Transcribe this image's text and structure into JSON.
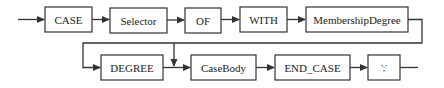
{
  "diagram": {
    "type": "syntax-diagram",
    "nodes": [
      {
        "id": "case",
        "label": "CASE",
        "x": 45,
        "y": 7,
        "w": 47,
        "h": 25
      },
      {
        "id": "selector",
        "label": "Selector",
        "x": 110,
        "y": 8,
        "w": 57,
        "h": 25
      },
      {
        "id": "of",
        "label": "OF",
        "x": 185,
        "y": 8,
        "w": 36,
        "h": 25
      },
      {
        "id": "with",
        "label": "WITH",
        "x": 240,
        "y": 7,
        "w": 47,
        "h": 25
      },
      {
        "id": "membership_degree",
        "label": "MembershipDegree",
        "x": 306,
        "y": 7,
        "w": 102,
        "h": 25
      },
      {
        "id": "degree",
        "label": "DEGREE",
        "x": 101,
        "y": 55,
        "w": 62,
        "h": 25
      },
      {
        "id": "case_body",
        "label": "CaseBody",
        "x": 191,
        "y": 55,
        "w": 65,
        "h": 25
      },
      {
        "id": "end_case",
        "label": "END_CASE",
        "x": 275,
        "y": 55,
        "w": 75,
        "h": 25
      },
      {
        "id": "semicolon",
        "label": "';'",
        "x": 368,
        "y": 55,
        "w": 32,
        "h": 25
      }
    ],
    "edges": [
      {
        "from": "start",
        "to": "case"
      },
      {
        "from": "case",
        "to": "selector"
      },
      {
        "from": "selector",
        "to": "of"
      },
      {
        "from": "of",
        "to": "with"
      },
      {
        "from": "with",
        "to": "membership_degree"
      },
      {
        "from": "membership_degree",
        "to": "degree"
      },
      {
        "from": "membership_degree",
        "to": "case_body",
        "note": "bypass DEGREE"
      },
      {
        "from": "degree",
        "to": "case_body"
      },
      {
        "from": "case_body",
        "to": "end_case"
      },
      {
        "from": "end_case",
        "to": "semicolon"
      },
      {
        "from": "semicolon",
        "to": "end"
      }
    ],
    "colors": {
      "stroke": "#333333",
      "text": "#222222",
      "background": "#ffffff"
    }
  }
}
